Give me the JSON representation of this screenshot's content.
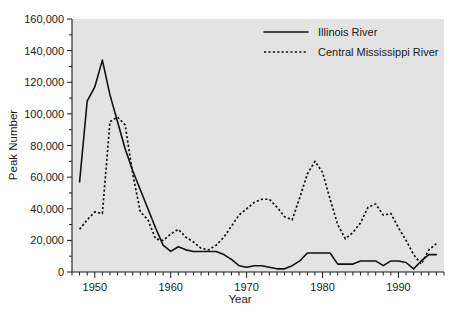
{
  "chart_data": {
    "type": "line",
    "title": "",
    "xlabel": "Year",
    "ylabel": "Peak Number",
    "xlim": [
      1947,
      1996
    ],
    "ylim": [
      0,
      160000
    ],
    "grid": false,
    "legend_position": "top-right",
    "y_ticks": [
      0,
      20000,
      40000,
      60000,
      80000,
      100000,
      120000,
      140000,
      160000
    ],
    "y_tick_labels": [
      "0",
      "20,000",
      "40,000",
      "60,000",
      "80,000",
      "100,000",
      "120,000",
      "140,000",
      "160,000"
    ],
    "y_minor_tick_interval": 10000,
    "x_ticks": [
      1950,
      1960,
      1970,
      1980,
      1990
    ],
    "x_tick_labels": [
      "1950",
      "1960",
      "1970",
      "1980",
      "1990"
    ],
    "x_minor_tick_interval": 1,
    "x": [
      1948,
      1949,
      1950,
      1951,
      1952,
      1953,
      1954,
      1955,
      1956,
      1957,
      1958,
      1959,
      1960,
      1961,
      1962,
      1963,
      1964,
      1965,
      1966,
      1967,
      1968,
      1969,
      1970,
      1971,
      1972,
      1973,
      1974,
      1975,
      1976,
      1977,
      1978,
      1979,
      1980,
      1981,
      1982,
      1983,
      1984,
      1985,
      1986,
      1987,
      1988,
      1989,
      1990,
      1991,
      1992,
      1993,
      1994,
      1995
    ],
    "series": [
      {
        "name": "Illinois River",
        "style": "solid",
        "color": "#111111",
        "values": [
          57000,
          108000,
          117000,
          134000,
          112000,
          95000,
          78000,
          64000,
          52000,
          40000,
          28000,
          17000,
          13000,
          16000,
          14000,
          13000,
          13000,
          13000,
          13000,
          11000,
          8000,
          4000,
          3000,
          4000,
          4000,
          3000,
          2000,
          2000,
          4000,
          7000,
          12000,
          12000,
          12000,
          12000,
          5000,
          5000,
          5000,
          7000,
          7000,
          7000,
          4000,
          7000,
          7000,
          6000,
          2000,
          7000,
          11000,
          11000
        ]
      },
      {
        "name": "Central Mississippi River",
        "style": "dotted",
        "color": "#111111",
        "values": [
          27000,
          33000,
          38000,
          37000,
          95000,
          98000,
          93000,
          62000,
          38000,
          33000,
          21000,
          20000,
          24000,
          27000,
          22000,
          19000,
          15000,
          14000,
          17000,
          22000,
          29000,
          36000,
          40000,
          44000,
          46000,
          46000,
          41000,
          35000,
          33000,
          47000,
          62000,
          70000,
          63000,
          46000,
          30000,
          21000,
          25000,
          31000,
          41000,
          43000,
          36000,
          37000,
          28000,
          20000,
          11000,
          5000,
          14000,
          18000
        ]
      }
    ]
  },
  "legend": {
    "items": [
      {
        "label": "Illinois River",
        "style": "solid"
      },
      {
        "label": "Central Mississippi River",
        "style": "dotted"
      }
    ]
  }
}
